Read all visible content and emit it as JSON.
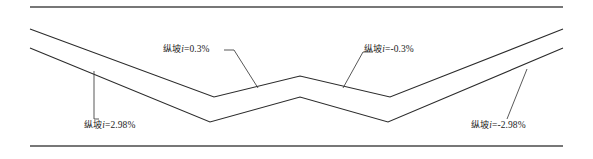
{
  "figure": {
    "kind": "road-longitudinal-profile",
    "width": 593,
    "height": 159,
    "background_color": "#ffffff",
    "line_color": "#2b2b2b",
    "rule_color": "#4a4a4a",
    "text_color": "#1d1d1d"
  },
  "rules": {
    "top": {
      "x1": 30,
      "y1": 7,
      "x2": 563,
      "y2": 7
    },
    "bottom": {
      "x1": 30,
      "y1": 146,
      "x2": 563,
      "y2": 146
    }
  },
  "chart_data": {
    "type": "line",
    "title": "",
    "xlabel": "",
    "ylabel": "",
    "series": [
      {
        "name": "upper-profile",
        "points": [
          {
            "x": 30,
            "y": 29
          },
          {
            "x": 214,
            "y": 97
          },
          {
            "x": 300,
            "y": 76
          },
          {
            "x": 390,
            "y": 97
          },
          {
            "x": 563,
            "y": 29
          }
        ]
      },
      {
        "name": "lower-profile",
        "points": [
          {
            "x": 30,
            "y": 48
          },
          {
            "x": 210,
            "y": 122
          },
          {
            "x": 300,
            "y": 97
          },
          {
            "x": 388,
            "y": 122
          },
          {
            "x": 563,
            "y": 48
          }
        ]
      }
    ],
    "annotations": [
      {
        "id": "left-grade",
        "text": "纵坡i=2.98%",
        "value": 2.98,
        "unit": "%"
      },
      {
        "id": "mid-left",
        "text": "纵坡i=0.3%",
        "value": 0.3,
        "unit": "%"
      },
      {
        "id": "mid-right",
        "text": "纵坡i=-0.3%",
        "value": -0.3,
        "unit": "%"
      },
      {
        "id": "right-grade",
        "text": "纵坡i=-2.98%",
        "value": -2.98,
        "unit": "%"
      }
    ]
  },
  "labels": {
    "left_grade": {
      "prefix": "纵坡",
      "symbol": "i",
      "value": "=2.98%"
    },
    "mid_left": {
      "prefix": "纵坡",
      "symbol": "i",
      "value": "=0.3%"
    },
    "mid_right": {
      "prefix": "纵坡",
      "symbol": "i",
      "value": "=-0.3%"
    },
    "right_grade": {
      "prefix": "纵坡",
      "symbol": "i",
      "value": "=-2.98%"
    }
  }
}
